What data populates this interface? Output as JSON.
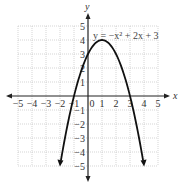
{
  "chart_data": {
    "type": "line",
    "title": "",
    "equation_label": "y = −x² + 2x + 3",
    "xlabel": "x",
    "ylabel": "y",
    "xlim": [
      -5,
      5
    ],
    "ylim": [
      -5,
      5
    ],
    "grid": true,
    "x_ticks": [
      "−5",
      "−4",
      "−3",
      "−2",
      "−1",
      "0",
      "1",
      "2",
      "3",
      "4",
      "5"
    ],
    "y_ticks": [
      "5",
      "4",
      "3",
      "2",
      "1",
      "−1",
      "−2",
      "−3",
      "−4",
      "−5"
    ],
    "series": [
      {
        "name": "y = -x^2 + 2x + 3",
        "x": [
          -1.83,
          -1.5,
          -1,
          -0.5,
          0,
          0.5,
          1,
          1.5,
          2,
          2.5,
          3,
          3.5,
          3.83
        ],
        "y": [
          -5,
          -2.25,
          0,
          1.75,
          3,
          3.75,
          4,
          3.75,
          3,
          1.75,
          0,
          -2.25,
          -5
        ]
      }
    ],
    "key_points": {
      "vertex": [
        1,
        4
      ],
      "y_intercept": [
        0,
        3
      ],
      "x_intercepts": [
        [
          -1,
          0
        ],
        [
          3,
          0
        ]
      ]
    }
  }
}
